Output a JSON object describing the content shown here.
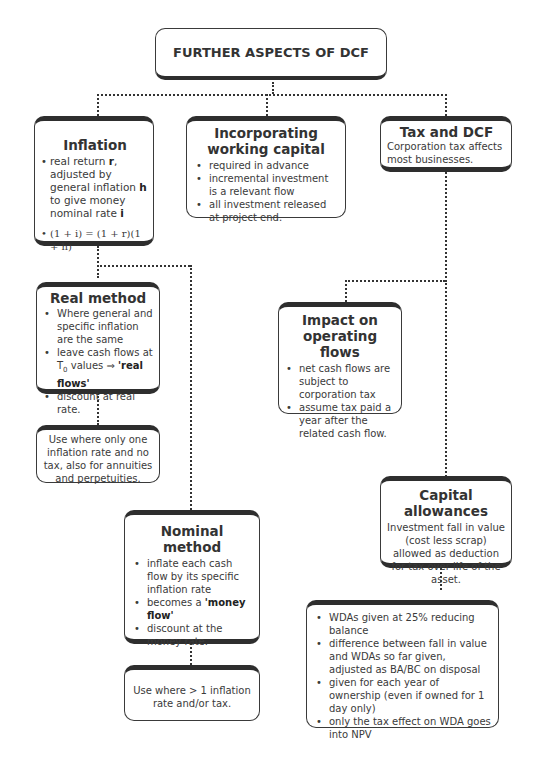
{
  "diagram": {
    "root": {
      "title": "FURTHER ASPECTS OF DCF"
    },
    "inflation": {
      "title": "Inflation",
      "items": [
        {
          "pre": "real return ",
          "b1": "r",
          "mid": ", adjusted by general inflation ",
          "b2": "h",
          "mid2": " to give money nominal rate ",
          "b3": "i"
        },
        {
          "text": "(1 + i) = (1 + r)(1 + h)"
        }
      ]
    },
    "working_capital": {
      "title": "Incorporating working capital",
      "items": [
        "required in advance",
        "incremental investment is a relevant flow",
        "all investment released at project end."
      ]
    },
    "tax_dcf": {
      "title": "Tax and DCF",
      "text": "Corporation tax affects most businesses."
    },
    "real_method": {
      "title": "Real method",
      "items": {
        "0": "Where general and specific inflation are the same",
        "1_pre": "leave cash flows at T",
        "1_sub": "0",
        "1_mid": " values ⇒ ",
        "1_bold": "'real flows'",
        "2": "discount at real rate."
      }
    },
    "real_use": {
      "text": "Use where only one inflation rate and no tax, also for annuities and perpetuities."
    },
    "nominal_method": {
      "title": "Nominal method",
      "items": {
        "0": "inflate each cash flow by its specific inflation rate",
        "1_pre": "becomes a ",
        "1_bold": "'money flow'",
        "2": "discount at the money rate."
      }
    },
    "nominal_use": {
      "text": "Use where > 1 inflation rate and/or tax."
    },
    "operating_flows": {
      "title": "Impact on operating flows",
      "items": [
        "net cash flows are subject to corporation tax",
        "assume tax paid a year after the related cash flow."
      ]
    },
    "capital_allowances": {
      "title": "Capital allowances",
      "text": "Investment fall in value (cost less scrap) allowed as deduction for tax over life of the asset."
    },
    "wda": {
      "items": [
        "WDAs given at 25% reducing balance",
        "difference between fall in value and WDAs so far given, adjusted as BA/BC on disposal",
        "given for each year of ownership (even if owned for 1 day only)",
        "only the tax effect on WDA goes into NPV"
      ]
    }
  }
}
